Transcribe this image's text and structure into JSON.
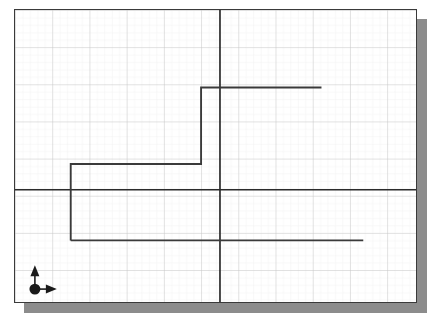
{
  "figure": {
    "title": "",
    "background_color": "#ffffff",
    "frame_color": "#3a3a3a",
    "shadow_color": "#8c8c8c"
  },
  "grid": {
    "minor_spacing_px": 7.48,
    "major_every": 5,
    "minor_color": "#e8e8e8",
    "major_color": "#c9c9c9",
    "minor_width_px": 0.6,
    "major_width_px": 0.9,
    "visible": true
  },
  "axes": {
    "color": "#2b2b2b",
    "width_px": 1.7,
    "x_axis_y_px": 190,
    "y_axis_x_px": 220,
    "x_axis_label": "",
    "y_axis_label": "",
    "x_tick_labels": [],
    "y_tick_labels": []
  },
  "origin_marker": {
    "dot_color": "#1a1a1a",
    "arrow_color": "#1a1a1a",
    "dot_x_px": 34,
    "dot_y_px": 290,
    "dot_radius_px": 5.5,
    "up_arrow_tip_y_px": 266,
    "right_arrow_tip_x_px": 56,
    "up_label": "",
    "right_label": ""
  },
  "chart_data": {
    "type": "line",
    "title": "",
    "subtitle": "",
    "xlabel": "",
    "ylabel": "",
    "series": [
      {
        "name": "step-waveform",
        "color": "#3a3a3a",
        "line_width_px": 1.9,
        "style": "step",
        "points_px": [
          [
            70,
            241
          ],
          [
            70,
            164
          ],
          [
            201,
            164
          ],
          [
            201,
            87
          ],
          [
            322,
            87
          ]
        ],
        "extra_segments_px": [
          [
            [
              70,
              241
            ],
            [
              364,
              241
            ]
          ]
        ],
        "levels_px": [
          241,
          164,
          87
        ],
        "transitions_x_px": [
          70,
          201
        ],
        "x_start_px": 70,
        "x_end_px": 364
      }
    ],
    "axis_ranges": {
      "x_px": [
        14,
        417
      ],
      "y_px": [
        9,
        303
      ]
    },
    "grid": true,
    "legend": "none",
    "annotations": []
  }
}
